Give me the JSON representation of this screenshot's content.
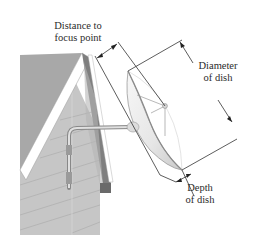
{
  "figure": {
    "labels": {
      "distance": {
        "line1": "Distance to",
        "line2": "focus point"
      },
      "diameter": {
        "line1": "Diameter",
        "line2": "of dish"
      },
      "depth": {
        "line1": "Depth",
        "line2": "of dish"
      }
    },
    "colors": {
      "wall_siding": "#c4c4c4",
      "roof_face": "#a9a9a9",
      "roof_trim": "#ffffff",
      "eave_shadow": "#7d7d7d",
      "dish_fill": "#eeeeee",
      "dish_rim": "#9a9a9a",
      "dimension_line": "#333333"
    }
  }
}
